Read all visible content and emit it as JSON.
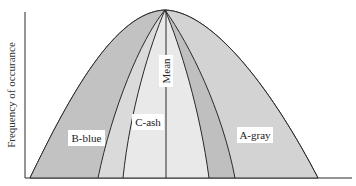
{
  "diagram": {
    "y_axis_label": "Frequency of occurance",
    "mean_label": "Mean",
    "regions": [
      {
        "id": "b-blue",
        "label": "B-blue",
        "color": "#c4c4c4"
      },
      {
        "id": "c-ash",
        "label": "C-ash",
        "color": "#e6e6e6"
      },
      {
        "id": "a-gray",
        "label": "A-gray",
        "color": "#d2d2d2"
      }
    ],
    "colors": {
      "line": "#2a2a2a",
      "outer_band": "#cfcfcf",
      "inner_band_dark": "#bdbdbd",
      "center_light": "#e8e8e8",
      "background": "#ffffff"
    }
  }
}
